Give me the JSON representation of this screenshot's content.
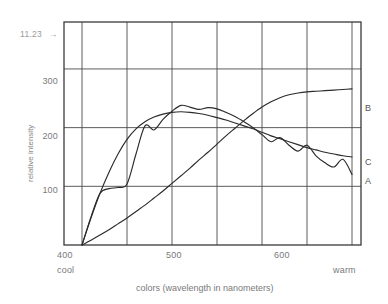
{
  "figure": {
    "number_label": "11.23",
    "arrow_glyph": "→"
  },
  "axes": {
    "ylabel": "relative intensity",
    "xlabel": "colors (wavelength in nanometers)",
    "y_ticks": [
      "300",
      "200",
      "100"
    ],
    "x_ticks": [
      "400",
      "500",
      "600"
    ],
    "x_left_note": "cool",
    "x_right_note": "warm"
  },
  "curve_labels": {
    "a": "A",
    "b": "B",
    "c": "C"
  },
  "colors": {
    "frame": "#3a3a3a",
    "grid": "#4a4a4a",
    "curve": "#2b2b2b",
    "text": "#7a7a7a",
    "background": "#ffffff"
  },
  "chart_data": {
    "type": "line",
    "title": "",
    "xlabel": "colors (wavelength in nanometers)",
    "ylabel": "relative intensity",
    "xlim": [
      380,
      710
    ],
    "ylim": [
      0,
      380
    ],
    "xticks": [
      400,
      500,
      600
    ],
    "yticks": [
      100,
      200,
      300
    ],
    "grid": true,
    "legend": "inline-right-edge",
    "annotations": [
      {
        "text": "cool",
        "x": 400,
        "position": "below-axis-left"
      },
      {
        "text": "warm",
        "x": 700,
        "position": "below-axis-right"
      },
      {
        "text": "11.23",
        "position": "upper-left-outside"
      }
    ],
    "x": [
      400,
      410,
      420,
      430,
      440,
      450,
      460,
      470,
      480,
      490,
      500,
      510,
      520,
      530,
      540,
      550,
      560,
      570,
      580,
      590,
      600,
      610,
      620,
      630,
      640,
      650,
      660,
      670,
      680,
      690,
      700
    ],
    "series": [
      {
        "name": "A",
        "label": "A",
        "description": "fluorescent-like spiky spectrum, peaks near 480nm then declines with ripples",
        "values": [
          0,
          48,
          88,
          96,
          98,
          104,
          155,
          203,
          196,
          214,
          228,
          238,
          235,
          231,
          234,
          232,
          226,
          219,
          210,
          200,
          188,
          176,
          183,
          170,
          160,
          170,
          152,
          140,
          133,
          146,
          120
        ]
      },
      {
        "name": "B",
        "label": "B",
        "description": "incandescent-like spectrum rising steadily toward the red end",
        "values": [
          0,
          8,
          17,
          26,
          36,
          46,
          57,
          68,
          80,
          92,
          105,
          118,
          131,
          145,
          158,
          172,
          186,
          199,
          212,
          224,
          235,
          244,
          251,
          256,
          259,
          261,
          262,
          263,
          264,
          265,
          266
        ]
      },
      {
        "name": "C",
        "label": "C",
        "description": "daylight-like smooth broad spectrum peaking near 520nm",
        "values": [
          0,
          46,
          88,
          124,
          155,
          180,
          198,
          210,
          218,
          223,
          226,
          227,
          226,
          224,
          221,
          217,
          213,
          208,
          203,
          198,
          192,
          186,
          181,
          176,
          171,
          166,
          162,
          158,
          155,
          152,
          150
        ]
      }
    ]
  }
}
